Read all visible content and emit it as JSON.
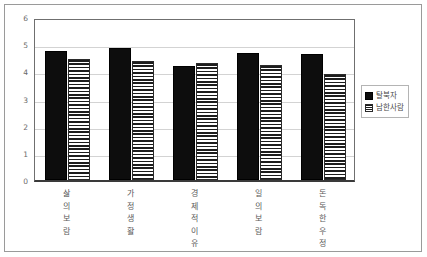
{
  "chart_data": {
    "type": "bar",
    "title": "",
    "subtitle": "",
    "xlabel": "",
    "ylabel": "",
    "ylim": [
      0,
      6
    ],
    "yticks": [
      0,
      1,
      2,
      3,
      4,
      5,
      6
    ],
    "ytick_labels": [
      "0",
      "1",
      "2",
      "3",
      "4",
      "5",
      "6"
    ],
    "grid": true,
    "grid_axis": "y",
    "legend_position": "right",
    "categories": [
      "삶의보람",
      "가정생활",
      "경제적이유",
      "일의보람",
      "돈독한우정"
    ],
    "series": [
      {
        "name": "탈북자",
        "fill": "solid-black",
        "color": "#0d0d0d",
        "values": [
          4.75,
          4.85,
          4.2,
          4.68,
          4.65
        ]
      },
      {
        "name": "남한사람",
        "fill": "horizontal-hatch",
        "color": "#1d1d1d",
        "values": [
          4.45,
          4.38,
          4.3,
          4.25,
          3.92
        ]
      }
    ]
  },
  "legend": {
    "entries": [
      {
        "label": "탈북자",
        "swatch": "black-square-swatch"
      },
      {
        "label": "남한사람",
        "swatch": "hatched-square-swatch"
      }
    ]
  }
}
